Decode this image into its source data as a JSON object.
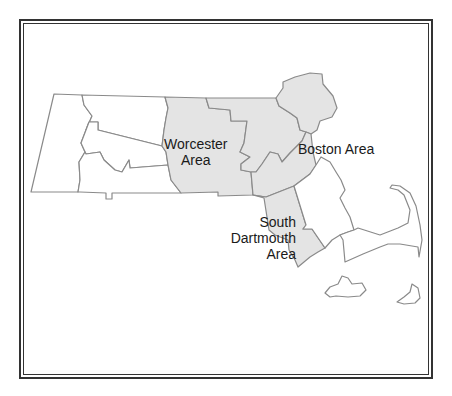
{
  "map": {
    "region": "Massachusetts",
    "colors": {
      "shaded_fill": "#e4e4e4",
      "unshaded_fill": "#ffffff",
      "border": "#8a8a8a",
      "frame": "#333333",
      "text": "#1a1a1a"
    },
    "labels": {
      "worcester": {
        "line1": "Worcester",
        "line2": "Area"
      },
      "boston": {
        "line1": "Boston Area"
      },
      "south_dartmouth": {
        "line1": "South",
        "line2": "Dartmouth",
        "line3": "Area"
      }
    },
    "highlighted_areas": [
      "Worcester Area",
      "Boston Area",
      "South Dartmouth Area"
    ]
  }
}
